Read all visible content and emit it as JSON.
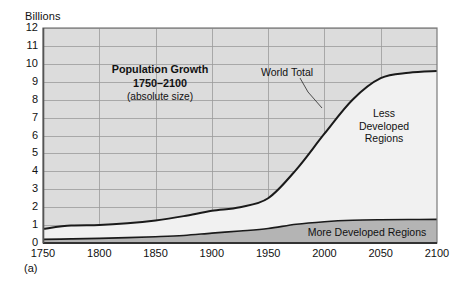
{
  "figure": {
    "label": "(a)",
    "y_axis_title": "Billions"
  },
  "annotations": {
    "title_line1": "Population Growth",
    "title_line2": "1750–2100",
    "title_line3": "(absolute size)",
    "world_total": "World Total",
    "less_developed_l1": "Less",
    "less_developed_l2": "Developed",
    "less_developed_l3": "Regions",
    "more_developed": "More Developed Regions"
  },
  "colors": {
    "plot_background": "#dcdcdc",
    "less_developed_fill": "#f1f1f1",
    "more_developed_fill": "#b4b4b4",
    "gridline": "#9a9a9a",
    "axis": "#4d4d4d",
    "curve": "#1a1a1a",
    "text": "#111111"
  },
  "chart_data": {
    "type": "area",
    "title": "Population Growth 1750–2100 (absolute size)",
    "xlabel": "",
    "ylabel": "Billions",
    "xlim": [
      1750,
      2100
    ],
    "ylim": [
      0,
      12
    ],
    "grid": true,
    "legend": "in-plot annotations",
    "x_ticks": [
      1750,
      1800,
      1850,
      1900,
      1950,
      2000,
      2050,
      2100
    ],
    "y_ticks": [
      0,
      1,
      2,
      3,
      4,
      5,
      6,
      7,
      8,
      9,
      10,
      11,
      12
    ],
    "x": [
      1750,
      1775,
      1800,
      1825,
      1850,
      1875,
      1900,
      1925,
      1950,
      1975,
      2000,
      2025,
      2050,
      2075,
      2100
    ],
    "series": [
      {
        "name": "World Total",
        "values": [
          0.79,
          0.97,
          1.0,
          1.1,
          1.26,
          1.5,
          1.8,
          2.0,
          2.5,
          4.1,
          6.1,
          8.0,
          9.2,
          9.5,
          9.6
        ]
      },
      {
        "name": "More Developed Regions",
        "values": [
          0.2,
          0.23,
          0.26,
          0.3,
          0.35,
          0.42,
          0.55,
          0.67,
          0.81,
          1.05,
          1.19,
          1.27,
          1.3,
          1.31,
          1.32
        ]
      },
      {
        "name": "Less Developed Regions",
        "values": [
          0.59,
          0.74,
          0.74,
          0.8,
          0.91,
          1.08,
          1.25,
          1.33,
          1.69,
          3.05,
          4.91,
          6.73,
          7.9,
          8.19,
          8.28
        ]
      }
    ]
  }
}
